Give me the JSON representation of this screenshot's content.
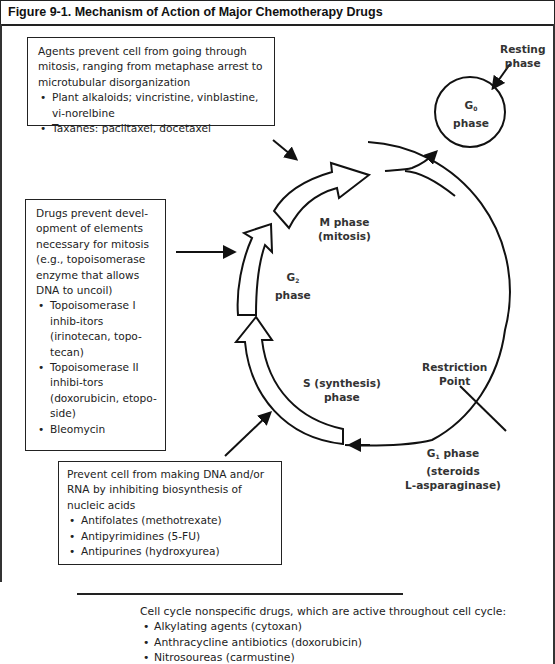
{
  "figure": {
    "title": "Figure 9-1. Mechanism of Action of Major Chemotherapy Drugs"
  },
  "boxes": {
    "mitosis_agents": {
      "intro": "Agents prevent cell from going through mitosis, ranging from metaphase arrest to microtubular disorganization",
      "items": [
        "Plant alkaloids; vincristine, vinblastine, vi-norelbine",
        "Taxanes: paclitaxel, docetaxel"
      ]
    },
    "g2_drugs": {
      "intro": "Drugs prevent devel-opment of elements necessary for mitosis (e.g., topoisomerase enzyme that allows DNA to uncoil)",
      "items": [
        "Topoisomerase I inhib-itors (irinotecan, topo-tecan)",
        "Topoisomerase II inhibi-tors (doxorubicin, etopo-side)",
        "Bleomycin"
      ]
    },
    "s_phase_drugs": {
      "intro": "Prevent cell from making DNA and/or RNA by inhibiting biosynthesis of nucleic acids",
      "items": [
        "Antifolates (methotrexate)",
        "Antipyrimidines (5-FU)",
        "Antipurines (hydroxyurea)"
      ]
    }
  },
  "cycle_labels": {
    "resting_line1": "Resting",
    "resting_line2": "phase",
    "g0_letter": "G",
    "g0_sub": "0",
    "g0_word": "phase",
    "m_line1": "M phase",
    "m_line2": "(mitosis)",
    "g2_letter": "G",
    "g2_sub": "2",
    "g2_word": "phase",
    "s_line1": "S (synthesis)",
    "s_line2": "phase",
    "restriction_line1": "Restriction",
    "restriction_line2": "Point",
    "g1_letter": "G",
    "g1_sub": "1",
    "g1_word": " phase",
    "g1_line2": "(steroids",
    "g1_line3": "L-asparaginase)"
  },
  "nonspecific": {
    "intro": "Cell cycle nonspecific drugs, which are active throughout cell cycle:",
    "items": [
      "Alkylating agents (cytoxan)",
      "Anthracycline antibiotics (doxorubicin)",
      "Nitrosoureas (carmustine)"
    ]
  }
}
